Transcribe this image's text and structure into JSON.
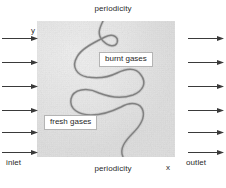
{
  "figure": {
    "title_top": "periodicity",
    "title_bottom": "periodicity",
    "axis_y_label": "y",
    "axis_x_label": "x",
    "inlet_label": "inlet",
    "outlet_label": "outlet",
    "region_labels": {
      "burnt": "burnt gases",
      "fresh": "fresh gases"
    },
    "colors": {
      "domain_fill": "#e3e3e3",
      "flame_front": "#6d6d6d",
      "arrow": "#3a3a3a",
      "callout_border": "#b4b4b4",
      "callout_fill": "#ffffff",
      "text": "#2a2a2a",
      "background": "#ffffff"
    },
    "arrows": {
      "inlet_icon": "arrow-right-icon",
      "outlet_icon": "arrow-right-icon",
      "inlet_count": 6,
      "outlet_count": 6,
      "inlet_rows_y": [
        38,
        62,
        86,
        110,
        132,
        152
      ],
      "outlet_rows_y": [
        38,
        62,
        86,
        110,
        132,
        152
      ]
    },
    "domain": {
      "left": 37,
      "top": 21,
      "width": 138,
      "height": 136
    },
    "flame_front": {
      "description": "wrinkled premixed flame front separating fresh gases (left) from burnt gases (right)",
      "path": "M 66 0 C 62 8 60 14 66 20 C 72 26 78 26 80 22 C 82 16 76 12 68 16 C 56 22 44 28 40 36 C 34 46 40 54 50 56 C 62 58 72 56 80 52 C 92 46 100 48 104 54 C 110 62 106 70 96 74 C 84 78 72 76 62 72 C 50 66 36 68 34 78 C 32 88 42 94 54 94 C 66 94 76 90 84 86 C 94 80 104 82 106 90 C 108 98 102 106 96 112 C 88 120 82 128 86 136"
    }
  }
}
